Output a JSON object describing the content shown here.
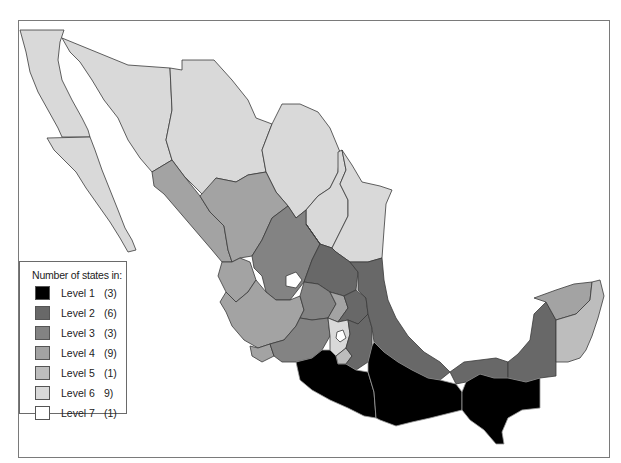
{
  "legend": {
    "title": "Number of states in:",
    "items": [
      {
        "label": "Level 1",
        "count": "(3)",
        "color": "#000000"
      },
      {
        "label": "Level 2",
        "count": "(6)",
        "color": "#686868"
      },
      {
        "label": "Level 3",
        "count": "(3)",
        "color": "#838383"
      },
      {
        "label": "Level 4",
        "count": "(9)",
        "color": "#a3a3a3"
      },
      {
        "label": "Level 5",
        "count": "(1)",
        "color": "#bdbdbd"
      },
      {
        "label": "Level 6",
        "count": "9)",
        "color": "#d9d9d9"
      },
      {
        "label": "Level 7",
        "count": "(1)",
        "color": "#ffffff"
      }
    ]
  },
  "map": {
    "subject": "Mexico states choropleth",
    "colors": {
      "level1": "#000000",
      "level2": "#686868",
      "level3": "#838383",
      "level4": "#a3a3a3",
      "level5": "#bdbdbd",
      "level6": "#d9d9d9",
      "level7": "#ffffff",
      "border": "#3a3a3a",
      "frame": "#7a7a7a"
    }
  }
}
